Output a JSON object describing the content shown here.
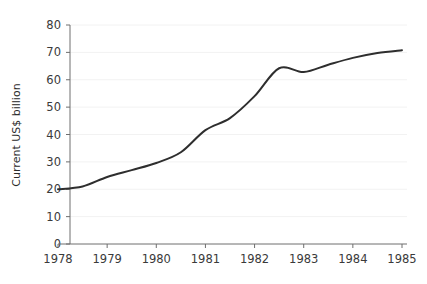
{
  "chart_data": {
    "type": "line",
    "title": "",
    "xlabel": "",
    "ylabel": "Current US$ billion",
    "xlim": [
      1978,
      1985
    ],
    "ylim": [
      0,
      80
    ],
    "grid": true,
    "grid_axis": "y",
    "legend": false,
    "line_color": "#2e2e2e",
    "x": [
      1978,
      1978.5,
      1979,
      1979.5,
      1980,
      1980.5,
      1981,
      1981.5,
      1982,
      1982.5,
      1983,
      1983.5,
      1984,
      1984.5,
      1985
    ],
    "values": [
      20.0,
      21.0,
      24.5,
      27.0,
      29.6,
      33.5,
      41.6,
      46.0,
      54.0,
      64.2,
      62.8,
      65.5,
      68.0,
      69.8,
      70.8
    ],
    "series": [
      {
        "name": "Current US$ billion",
        "values": [
          20.0,
          21.0,
          24.5,
          27.0,
          29.6,
          33.5,
          41.6,
          46.0,
          54.0,
          64.2,
          62.8,
          65.5,
          68.0,
          69.8,
          70.8
        ]
      }
    ],
    "y_ticks": [
      0,
      10,
      20,
      30,
      40,
      50,
      60,
      70,
      80
    ],
    "y_tick_labels": [
      "0",
      "10",
      "20",
      "30",
      "40",
      "50",
      "60",
      "70",
      "80"
    ],
    "x_ticks": [
      1978,
      1979,
      1980,
      1981,
      1982,
      1983,
      1984,
      1985
    ],
    "x_tick_labels": [
      "1978",
      "1979",
      "1980",
      "1981",
      "1982",
      "1983",
      "1984",
      "1985"
    ]
  },
  "colors": {
    "line": "#2e2e2e",
    "axis": "#6e6e6e",
    "grid": "#f2f2f2",
    "text": "#333333",
    "background": "#ffffff"
  }
}
